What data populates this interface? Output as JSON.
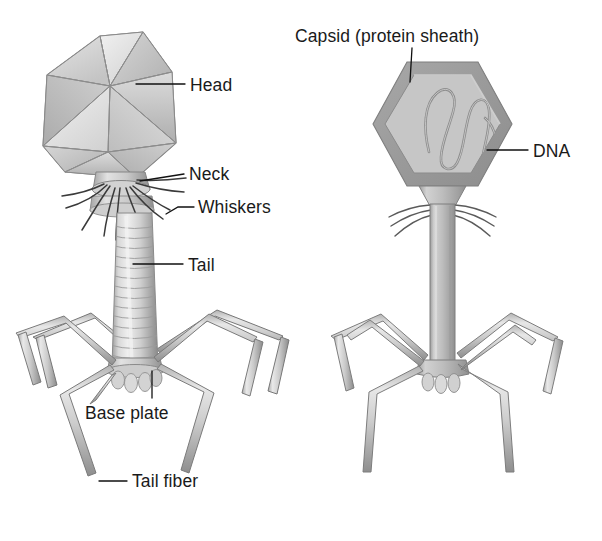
{
  "figure": {
    "background_color": "#ffffff",
    "ink_color": "#1a1a1a",
    "panels": [
      {
        "name": "realistic-rendering",
        "side": "left"
      },
      {
        "name": "schematic-cutaway",
        "side": "right"
      }
    ]
  },
  "labels": {
    "head": "Head",
    "neck": "Neck",
    "whiskers": "Whiskers",
    "tail": "Tail",
    "base_plate": "Base plate",
    "tail_fiber": "Tail fiber",
    "capsid": "Capsid (protein sheath)",
    "dna": "DNA"
  },
  "colors": {
    "body_light": "#dcdcdc",
    "body_mid": "#c2c2c2",
    "body_dark": "#a6a6a6",
    "body_shadow": "#8d8d8d",
    "outline": "#6e6e6e",
    "outline_soft": "#9a9a9a",
    "capsid_wall": "#9d9d9d",
    "capsid_fill": "#c6c6c6",
    "dna_stroke": "#8f8f8f",
    "label_text": "#1a1a1a",
    "leader_line": "#111111"
  },
  "structures": {
    "left_panel": [
      "icosahedral head",
      "neck with collar",
      "six whiskers",
      "striated contractile tail sheath",
      "base plate with pins",
      "six jointed tail fibers"
    ],
    "right_panel": [
      "hexagonal capsid outline",
      "folded DNA strand inside capsid",
      "whiskers at neck",
      "straight tail tube",
      "base plate with pins",
      "six jointed tail fibers"
    ]
  }
}
